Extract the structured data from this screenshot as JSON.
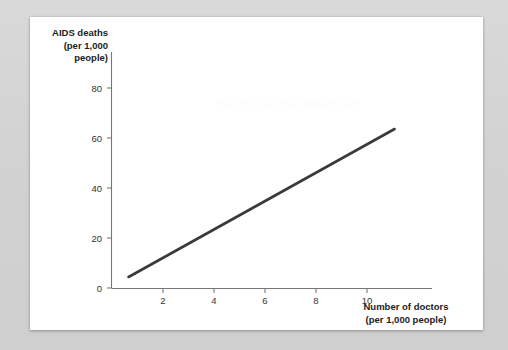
{
  "page": {
    "background_color": "#d6d6d6",
    "card_color": "#ffffff",
    "watermark_text": "Death on the Interstate"
  },
  "chart_data": {
    "type": "line",
    "title": "",
    "subtitle": "",
    "xlabel": "Number of doctors\n(per 1,000 people)",
    "ylabel": "AIDS deaths\n(per 1,000\npeople)",
    "xlabel_lines": [
      "Number of doctors",
      "(per 1,000 people)"
    ],
    "ylabel_lines": [
      "AIDS",
      "deaths",
      "(per 1,000",
      "people)"
    ],
    "xlim": [
      0,
      12
    ],
    "ylim": [
      0,
      88
    ],
    "xticks": [
      2,
      4,
      6,
      8,
      10
    ],
    "yticks": [
      0,
      20,
      40,
      60,
      80
    ],
    "xtick_labels": [
      "2",
      "4",
      "6",
      "8",
      "10"
    ],
    "ytick_labels": [
      "0",
      "20",
      "40",
      "60",
      "80"
    ],
    "grid": false,
    "legend": null,
    "series": [
      {
        "name": "AIDS deaths vs doctors",
        "color": "#3a3a3a",
        "x": [
          0.67,
          11.1
        ],
        "y": [
          4.4,
          63.6
        ],
        "slope": 5.67,
        "intercept": 0.6
      }
    ],
    "annotations": []
  }
}
